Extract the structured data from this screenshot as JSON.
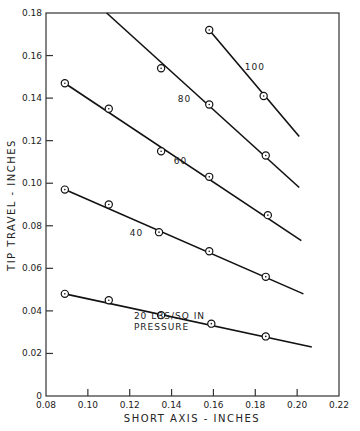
{
  "chart_data": {
    "type": "line",
    "title": "",
    "xlabel": "SHORT AXIS - INCHES",
    "ylabel": "TIP TRAVEL - INCHES",
    "xlim": [
      0.08,
      0.22
    ],
    "ylim": [
      0,
      0.18
    ],
    "x_ticks": [
      "0.08",
      "0.10",
      "0.12",
      "0.14",
      "0.16",
      "0.18",
      "0.20",
      "0.22"
    ],
    "y_ticks": [
      "0",
      "0.02",
      "0.04",
      "0.06",
      "0.08",
      "0.10",
      "0.12",
      "0.14",
      "0.16",
      "0.18"
    ],
    "grid": false,
    "series": [
      {
        "name": "20 LBS/SQ IN PRESSURE",
        "label": "20 LBS/SQ IN",
        "label2": "PRESSURE",
        "points": [
          [
            0.089,
            0.048
          ],
          [
            0.11,
            0.045
          ],
          [
            0.135,
            0.038
          ],
          [
            0.159,
            0.034
          ],
          [
            0.185,
            0.028
          ]
        ],
        "line": [
          [
            0.089,
            0.048
          ],
          [
            0.207,
            0.023
          ]
        ]
      },
      {
        "name": "40",
        "label": "40",
        "points": [
          [
            0.089,
            0.097
          ],
          [
            0.11,
            0.09
          ],
          [
            0.134,
            0.077
          ],
          [
            0.158,
            0.068
          ],
          [
            0.185,
            0.056
          ]
        ],
        "line": [
          [
            0.089,
            0.097
          ],
          [
            0.203,
            0.048
          ]
        ]
      },
      {
        "name": "60",
        "label": "60",
        "points": [
          [
            0.089,
            0.147
          ],
          [
            0.11,
            0.135
          ],
          [
            0.135,
            0.115
          ],
          [
            0.158,
            0.103
          ],
          [
            0.186,
            0.085
          ]
        ],
        "line": [
          [
            0.089,
            0.147
          ],
          [
            0.202,
            0.073
          ]
        ]
      },
      {
        "name": "80",
        "label": "80",
        "points": [
          [
            0.135,
            0.154
          ],
          [
            0.158,
            0.137
          ],
          [
            0.185,
            0.113
          ]
        ],
        "line": [
          [
            0.109,
            0.18
          ],
          [
            0.201,
            0.098
          ]
        ]
      },
      {
        "name": "100",
        "label": "100",
        "points": [
          [
            0.158,
            0.172
          ],
          [
            0.184,
            0.141
          ]
        ],
        "line": [
          [
            0.158,
            0.172
          ],
          [
            0.201,
            0.122
          ]
        ]
      }
    ],
    "annotations": [
      {
        "text": "100",
        "x": 0.175,
        "y": 0.153
      },
      {
        "text": "80",
        "x": 0.143,
        "y": 0.138
      },
      {
        "text": "60",
        "x": 0.141,
        "y": 0.109
      },
      {
        "text": "40",
        "x": 0.12,
        "y": 0.075
      },
      {
        "text": "20 LBS/SQ IN",
        "x": 0.122,
        "y": 0.036
      },
      {
        "text": "PRESSURE",
        "x": 0.122,
        "y": 0.031
      }
    ]
  }
}
